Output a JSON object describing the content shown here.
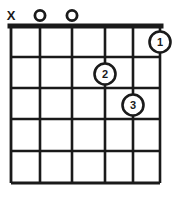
{
  "diagram": {
    "colors": {
      "ink": "#1a1a1a",
      "paper": "#ffffff"
    },
    "geometry": {
      "width": 181,
      "height": 198,
      "grid_left": 11,
      "grid_right": 160,
      "nut_y": 26,
      "grid_bottom": 183,
      "string_x": [
        11,
        40,
        72,
        105,
        133,
        160
      ],
      "fret_y": [
        26,
        57,
        88,
        119,
        151,
        183
      ],
      "nut_thickness": 4,
      "line_thickness": 2.4,
      "dot_radius": 11
    },
    "strings": {
      "count": 6,
      "labels": [
        "1",
        "2",
        "3",
        "4",
        "5",
        "6"
      ]
    },
    "frets": {
      "count": 5,
      "has_nut": true,
      "position_label": ""
    },
    "top_markers": [
      {
        "symbol": "X",
        "name": "mute-marker",
        "string_index": 0,
        "meaning": "muted"
      },
      {
        "symbol": "O",
        "name": "open-marker",
        "string_index": 1,
        "meaning": "open"
      },
      {
        "symbol": "O",
        "name": "open-marker",
        "string_index": 2,
        "meaning": "open"
      }
    ],
    "finger_dots": [
      {
        "label": "1",
        "string_index": 5,
        "fret": 1,
        "cx": 160,
        "cy": 42
      },
      {
        "label": "2",
        "string_index": 3,
        "fret": 2,
        "cx": 105,
        "cy": 74
      },
      {
        "label": "3",
        "string_index": 4,
        "fret": 3,
        "cx": 133,
        "cy": 105
      }
    ]
  }
}
